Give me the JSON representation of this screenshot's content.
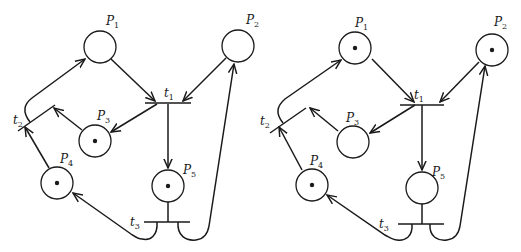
{
  "diagrams": [
    {
      "name": "before",
      "places": [
        {
          "id": "P1",
          "label": "P",
          "sub": "1",
          "tokens": 0
        },
        {
          "id": "P2",
          "label": "P",
          "sub": "2",
          "tokens": 0
        },
        {
          "id": "P3",
          "label": "P",
          "sub": "3",
          "tokens": 1
        },
        {
          "id": "P4",
          "label": "P",
          "sub": "4",
          "tokens": 1
        },
        {
          "id": "P5",
          "label": "P",
          "sub": "5",
          "tokens": 1
        }
      ],
      "transitions": [
        {
          "id": "t1",
          "label": "t",
          "sub": "1"
        },
        {
          "id": "t2",
          "label": "t",
          "sub": "2"
        },
        {
          "id": "t3",
          "label": "t",
          "sub": "3"
        }
      ]
    },
    {
      "name": "after",
      "places": [
        {
          "id": "P1",
          "label": "P",
          "sub": "1",
          "tokens": 1
        },
        {
          "id": "P2",
          "label": "P",
          "sub": "2",
          "tokens": 1
        },
        {
          "id": "P3",
          "label": "P",
          "sub": "3",
          "tokens": 0
        },
        {
          "id": "P4",
          "label": "P",
          "sub": "4",
          "tokens": 1
        },
        {
          "id": "P5",
          "label": "P",
          "sub": "5",
          "tokens": 0
        }
      ],
      "transitions": [
        {
          "id": "t1",
          "label": "t",
          "sub": "1"
        },
        {
          "id": "t2",
          "label": "t",
          "sub": "2"
        },
        {
          "id": "t3",
          "label": "t",
          "sub": "3"
        }
      ]
    }
  ],
  "arcs": [
    "P1 -> t1",
    "P2 -> t1",
    "t1 -> P3",
    "t1 -> P5",
    "P3 -> t2",
    "P4 -> t2",
    "t2 -> P1",
    "P5 -> t3",
    "t3 -> P4",
    "t3 -> P2"
  ]
}
